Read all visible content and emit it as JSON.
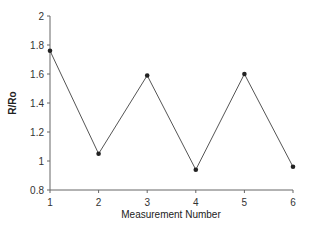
{
  "chart_data": {
    "type": "line",
    "title": "",
    "xlabel": "Measurement Number",
    "ylabel": "R/Ro",
    "x": [
      1,
      2,
      3,
      4,
      5,
      6
    ],
    "series": [
      {
        "name": "R/Ro",
        "values": [
          1.76,
          1.05,
          1.59,
          0.94,
          1.6,
          0.96
        ]
      }
    ],
    "xlim": [
      1,
      6
    ],
    "ylim": [
      0.8,
      2
    ],
    "xticks": [
      "1",
      "2",
      "3",
      "4",
      "5",
      "6"
    ],
    "yticks": [
      "0.8",
      "1",
      "1.2",
      "1.4",
      "1.6",
      "1.8",
      "2"
    ],
    "grid": false,
    "legend": "none",
    "colors": {
      "line": "#555555",
      "marker": "#222222",
      "axis": "#666666"
    }
  }
}
